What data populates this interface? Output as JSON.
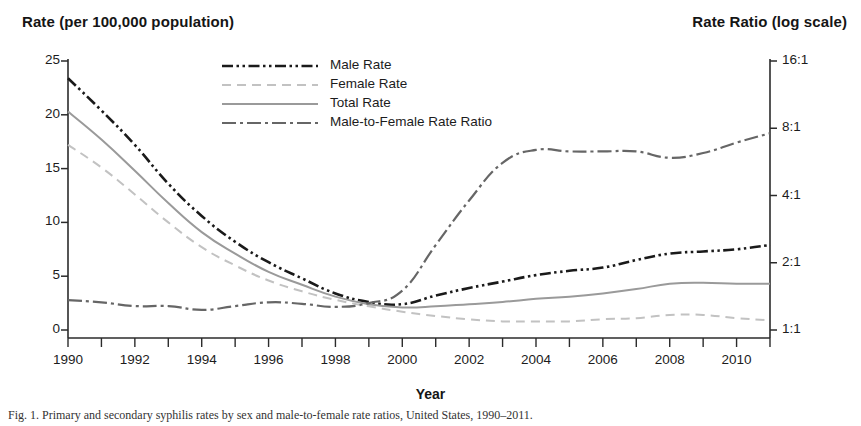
{
  "figure": {
    "left_axis_title": "Rate (per 100,000 population)",
    "right_axis_title": "Rate Ratio (log scale)",
    "x_axis_title": "Year",
    "caption": "Fig. 1.  Primary and secondary syphilis rates by sex and male-to-female rate ratios, United States, 1990–2011."
  },
  "legend": {
    "items": [
      {
        "label": "Male Rate",
        "key": "male",
        "color": "#1a1a1a",
        "style": "dash-dot-dot"
      },
      {
        "label": "Female Rate",
        "key": "female",
        "color": "#c2c2c2",
        "style": "dashed"
      },
      {
        "label": "Total Rate",
        "key": "total",
        "color": "#9a9a9a",
        "style": "solid"
      },
      {
        "label": "Male-to-Female Rate Ratio",
        "key": "ratio",
        "color": "#666666",
        "style": "dash-dot"
      }
    ]
  },
  "axes": {
    "left": {
      "label": "Rate (per 100,000 population)",
      "ticks": [
        "0",
        "5",
        "10",
        "15",
        "20",
        "25"
      ],
      "values": [
        0,
        5,
        10,
        15,
        20,
        25
      ],
      "min": 0,
      "max": 25
    },
    "right": {
      "label": "Rate Ratio (log scale)",
      "ticks": [
        "1:1",
        "2:1",
        "4:1",
        "8:1",
        "16:1"
      ],
      "values": [
        1,
        2,
        4,
        8,
        16
      ],
      "min": 1,
      "max": 16,
      "scale": "log"
    },
    "x": {
      "label": "Year",
      "ticks": [
        "1990",
        "1992",
        "1994",
        "1996",
        "1998",
        "2000",
        "2002",
        "2004",
        "2006",
        "2008",
        "2010"
      ],
      "min": 1990,
      "max": 2011
    }
  },
  "chart_data": {
    "type": "line",
    "title": "",
    "subtitle": "",
    "xlabel": "Year",
    "ylabel": "Rate (per 100,000 population)",
    "y2label": "Rate Ratio (log scale)",
    "xlim": [
      1990,
      2011
    ],
    "ylim": [
      0,
      25
    ],
    "y2lim": [
      1,
      16
    ],
    "y2scale": "log",
    "grid": false,
    "legend_position": "top-center",
    "x": [
      1990,
      1991,
      1992,
      1993,
      1994,
      1995,
      1996,
      1997,
      1998,
      1999,
      2000,
      2001,
      2002,
      2003,
      2004,
      2005,
      2006,
      2007,
      2008,
      2009,
      2010,
      2011
    ],
    "series": [
      {
        "name": "Male Rate",
        "axis": "left",
        "color": "#1a1a1a",
        "values": [
          23.4,
          20.4,
          17.2,
          13.6,
          10.6,
          8.2,
          6.3,
          4.8,
          3.4,
          2.6,
          2.4,
          3.2,
          3.9,
          4.5,
          5.1,
          5.5,
          5.8,
          6.5,
          7.1,
          7.3,
          7.5,
          7.9
        ]
      },
      {
        "name": "Female Rate",
        "axis": "left",
        "color": "#c2c2c2",
        "values": [
          17.2,
          15.1,
          12.6,
          10.0,
          7.7,
          6.0,
          4.6,
          3.6,
          2.8,
          2.2,
          1.7,
          1.3,
          1.0,
          0.8,
          0.8,
          0.8,
          1.0,
          1.1,
          1.4,
          1.4,
          1.1,
          0.9
        ]
      },
      {
        "name": "Total Rate",
        "axis": "left",
        "color": "#9a9a9a",
        "values": [
          20.3,
          17.7,
          14.8,
          11.8,
          9.1,
          7.1,
          5.4,
          4.2,
          3.1,
          2.4,
          2.1,
          2.2,
          2.4,
          2.6,
          2.9,
          3.1,
          3.4,
          3.8,
          4.3,
          4.4,
          4.3,
          4.3
        ]
      },
      {
        "name": "Male-to-Female Rate Ratio",
        "axis": "right",
        "color": "#666666",
        "values": [
          1.36,
          1.33,
          1.28,
          1.28,
          1.23,
          1.28,
          1.33,
          1.31,
          1.27,
          1.32,
          1.5,
          2.4,
          3.8,
          5.6,
          6.4,
          6.3,
          6.3,
          6.3,
          5.9,
          6.2,
          6.9,
          7.6
        ]
      }
    ]
  }
}
